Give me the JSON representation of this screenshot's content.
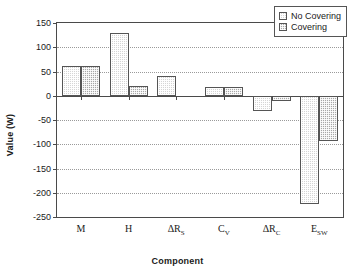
{
  "chart_data": {
    "type": "bar",
    "title": "",
    "xlabel": "Component",
    "ylabel": "Value (W)",
    "categories": [
      "M",
      "H",
      "ΔR_S",
      "C_V",
      "ΔR_C",
      "E_SW"
    ],
    "category_labels": [
      {
        "base": "M",
        "sub": ""
      },
      {
        "base": "H",
        "sub": ""
      },
      {
        "base": "ΔR",
        "sub": "S"
      },
      {
        "base": "C",
        "sub": "V"
      },
      {
        "base": "ΔR",
        "sub": "C"
      },
      {
        "base": "E",
        "sub": "SW"
      }
    ],
    "series": [
      {
        "name": "No Covering",
        "values": [
          62,
          130,
          40,
          19,
          -32,
          -224
        ],
        "color": "#d5d5d5"
      },
      {
        "name": "Covering",
        "values": [
          62,
          20,
          0,
          19,
          -10,
          -93
        ],
        "color": "#a8a8a8"
      }
    ],
    "ylim": [
      -250,
      150
    ],
    "yticks": [
      150,
      100,
      50,
      0,
      -50,
      -100,
      -150,
      -200,
      -250
    ],
    "ytick_labels": [
      "150",
      "100",
      "50",
      "0",
      "-50",
      "-100",
      "-150",
      "-200",
      "-250"
    ],
    "grid": true,
    "grid_style": "dotted-horizontal",
    "legend_position": "top-right",
    "axis_color": "#4a4a4a",
    "grid_color": "#9a9a9a"
  }
}
